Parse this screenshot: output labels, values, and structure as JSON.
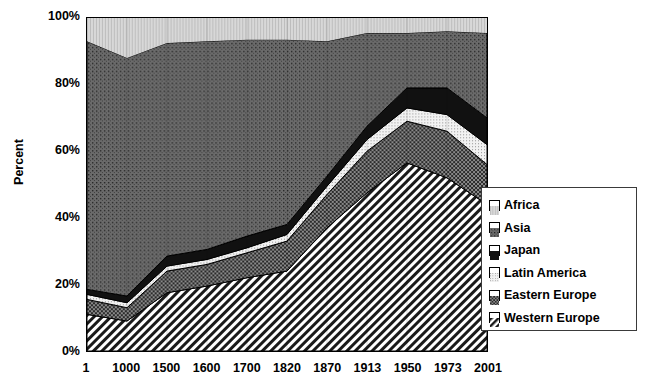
{
  "chart_data": {
    "type": "area",
    "stacked": true,
    "title": "",
    "xlabel": "",
    "ylabel": "Percent",
    "categories": [
      "1",
      "1000",
      "1500",
      "1600",
      "1700",
      "1820",
      "1870",
      "1913",
      "1950",
      "1973",
      "2001"
    ],
    "x": [
      1,
      1000,
      1500,
      1600,
      1700,
      1820,
      1870,
      1913,
      1950,
      1973,
      2001
    ],
    "ylim": [
      0,
      100
    ],
    "yticks": [
      "0%",
      "20%",
      "40%",
      "60%",
      "80%",
      "100%"
    ],
    "ytick_values": [
      0,
      20,
      40,
      60,
      80,
      100
    ],
    "grid": false,
    "legend_position": "right-inside",
    "stack_order_bottom_to_top": [
      "Western Europe",
      "Eastern Europe",
      "Latin America",
      "Japan",
      "Asia",
      "Africa"
    ],
    "series": [
      {
        "name": "Western Europe",
        "pattern": "diagonal-hatch",
        "color": "#ffffff",
        "values": [
          11.0,
          9.0,
          17.5,
          19.5,
          22.0,
          24.0,
          37.0,
          47.5,
          56.5,
          52.0,
          44.0
        ]
      },
      {
        "name": "Eastern Europe",
        "pattern": "dark-dotted",
        "color": "#767676",
        "values": [
          4.5,
          4.0,
          6.5,
          6.5,
          7.5,
          9.0,
          10.0,
          12.5,
          12.5,
          14.0,
          12.0
        ]
      },
      {
        "name": "Latin America",
        "pattern": "light-dotted",
        "color": "#e3e3e3",
        "values": [
          1.5,
          1.5,
          1.5,
          1.5,
          1.5,
          2.0,
          2.5,
          3.5,
          4.0,
          5.0,
          6.0
        ]
      },
      {
        "name": "Japan",
        "pattern": "solid-black",
        "color": "#111111",
        "values": [
          1.5,
          2.0,
          3.0,
          3.0,
          3.5,
          3.0,
          3.0,
          4.0,
          6.0,
          8.0,
          8.0
        ]
      },
      {
        "name": "Asia",
        "pattern": "medium-dotted",
        "color": "#5e5e5e",
        "values": [
          74.5,
          71.5,
          64.0,
          62.5,
          59.0,
          55.5,
          40.5,
          28.0,
          16.5,
          17.0,
          25.5
        ]
      },
      {
        "name": "Africa",
        "pattern": "very-light-dotted",
        "color": "#cfcfcf",
        "values": [
          7.0,
          12.0,
          7.5,
          7.0,
          6.5,
          6.5,
          7.0,
          4.5,
          4.5,
          4.0,
          4.5
        ]
      }
    ],
    "cumulative_tops": {
      "Western Europe": [
        11.0,
        9.0,
        17.5,
        19.5,
        22.0,
        24.0,
        37.0,
        47.5,
        56.5,
        52.0,
        44.0
      ],
      "Eastern Europe": [
        15.5,
        13.0,
        24.0,
        26.0,
        29.5,
        33.0,
        47.0,
        60.0,
        69.0,
        66.0,
        56.0
      ],
      "Latin America": [
        17.0,
        14.5,
        25.5,
        27.5,
        31.0,
        35.0,
        49.5,
        63.5,
        73.0,
        71.0,
        62.0
      ],
      "Japan": [
        18.5,
        16.5,
        28.5,
        30.5,
        34.5,
        38.0,
        52.5,
        67.5,
        79.0,
        79.0,
        70.0
      ],
      "Asia": [
        93.0,
        88.0,
        92.5,
        93.0,
        93.5,
        93.5,
        93.0,
        95.5,
        95.5,
        96.0,
        95.5
      ],
      "Africa": [
        100,
        100,
        100,
        100,
        100,
        100,
        100,
        100,
        100,
        100,
        100
      ]
    }
  },
  "axes": {
    "y_title": "Percent",
    "y_ticks": [
      "100%",
      "80%",
      "60%",
      "40%",
      "20%",
      "0%"
    ],
    "x_ticks": [
      "1",
      "1000",
      "1500",
      "1600",
      "1700",
      "1820",
      "1870",
      "1913",
      "1950",
      "1973",
      "2001"
    ]
  },
  "legend": {
    "items": [
      {
        "label": "Africa",
        "swatch": "swatch-africa"
      },
      {
        "label": "Asia",
        "swatch": "swatch-asia"
      },
      {
        "label": "Japan",
        "swatch": "swatch-japan"
      },
      {
        "label": "Latin America",
        "swatch": "swatch-latin-america"
      },
      {
        "label": "Eastern Europe",
        "swatch": "swatch-eastern-europe"
      },
      {
        "label": "Western Europe",
        "swatch": "swatch-western-europe"
      }
    ]
  }
}
